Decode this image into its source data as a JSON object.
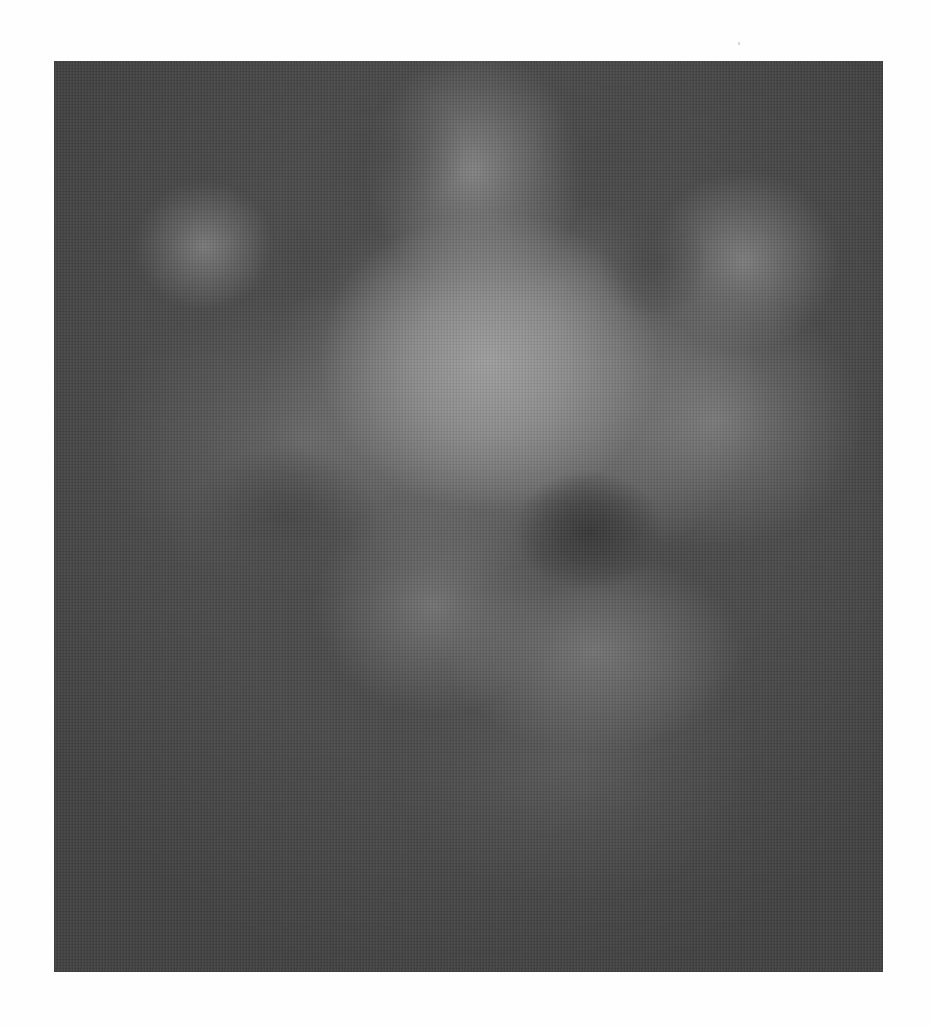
{
  "figure": {
    "kind": "blurred grayscale image",
    "colors": {
      "page_background": "#fefefe",
      "image_background": "#4b4b4b",
      "brightest_region": "#9a9a9a",
      "darkest_region": "#3e3e3e"
    }
  }
}
